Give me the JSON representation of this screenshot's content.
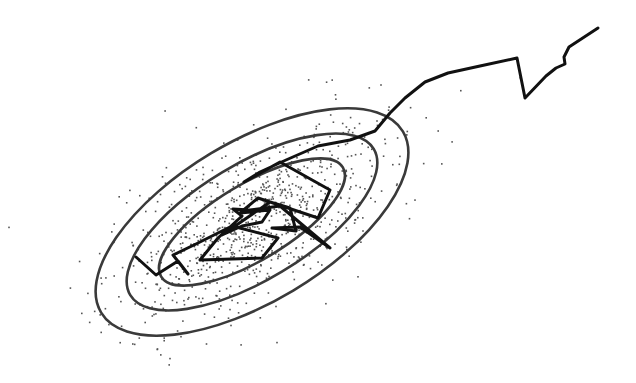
{
  "diagram": {
    "type": "sampler-trajectory-over-gaussian-contours",
    "background": "#ffffff",
    "contour_color": "#3a3a3a",
    "trail_color": "#111111",
    "sample_color": "#555555",
    "center": [
      252,
      222
    ],
    "rotation_deg": -31,
    "contours": [
      {
        "name": "outer",
        "rx": 176,
        "ry": 80
      },
      {
        "name": "middle",
        "rx": 142,
        "ry": 58
      },
      {
        "name": "inner",
        "rx": 106,
        "ry": 38
      }
    ],
    "trail_points": [
      [
        598,
        28
      ],
      [
        569,
        47
      ],
      [
        564,
        57
      ],
      [
        565,
        64
      ],
      [
        556,
        68
      ],
      [
        546,
        76
      ],
      [
        525,
        98
      ],
      [
        517,
        58
      ],
      [
        480,
        66
      ],
      [
        448,
        73
      ],
      [
        425,
        82
      ],
      [
        405,
        98
      ],
      [
        390,
        113
      ],
      [
        375,
        131
      ],
      [
        350,
        140
      ],
      [
        318,
        146
      ],
      [
        286,
        160
      ],
      [
        260,
        172
      ],
      [
        244,
        182
      ],
      [
        280,
        162
      ],
      [
        330,
        190
      ],
      [
        318,
        218
      ],
      [
        258,
        198
      ],
      [
        240,
        213
      ],
      [
        270,
        210
      ],
      [
        262,
        222
      ],
      [
        242,
        226
      ],
      [
        222,
        235
      ],
      [
        270,
        202
      ],
      [
        290,
        208
      ],
      [
        296,
        231
      ],
      [
        272,
        228
      ],
      [
        300,
        227
      ],
      [
        330,
        248
      ],
      [
        280,
        206
      ],
      [
        250,
        210
      ],
      [
        233,
        209
      ],
      [
        242,
        216
      ],
      [
        218,
        238
      ],
      [
        200,
        260
      ],
      [
        262,
        258
      ],
      [
        278,
        238
      ],
      [
        232,
        226
      ],
      [
        196,
        244
      ],
      [
        173,
        255
      ],
      [
        188,
        274
      ],
      [
        178,
        261
      ],
      [
        156,
        275
      ],
      [
        136,
        257
      ]
    ],
    "sample_count": 900,
    "sample_seed": 7
  }
}
